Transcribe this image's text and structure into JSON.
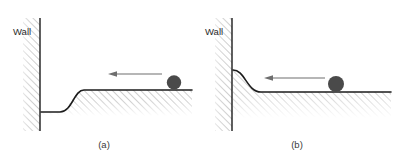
{
  "figure": {
    "background_color": "#ffffff",
    "panels": [
      {
        "id": "a",
        "caption": "(a)",
        "wall_label": "Wall",
        "description": "Ball rolling left toward a wall with ground that dips downward into a depression at the wall base",
        "ground_profile": "flat-plateau-then-S-curve-down-to-wall-base",
        "ball": {
          "name": "ball",
          "color": "#4a4a4a",
          "radius_px": 7,
          "center_x_px": 174,
          "center_y_px": 82
        },
        "arrow": {
          "name": "velocity-arrow",
          "direction": "left",
          "color": "#6e6e6e",
          "x_start_px": 162,
          "x_end_px": 110,
          "y_px": 74
        },
        "wall": {
          "x_px": 40,
          "top_y_px": 18,
          "bottom_y_px": 131,
          "hatch_side": "left",
          "hatch_width_px": 17
        },
        "ground": {
          "flat_y_px": 90,
          "base_y_px": 112,
          "curve_start_x_px": 78,
          "curve_end_x_px": 41,
          "right_edge_x_px": 192
        }
      },
      {
        "id": "b",
        "caption": "(b)",
        "wall_label": "Wall",
        "description": "Ball rolling left toward a wall with ground that rises into a hump at the wall base",
        "ground_profile": "flat-then-hump-rising-up-to-wall",
        "ball": {
          "name": "ball",
          "color": "#4a4a4a",
          "radius_px": 8,
          "center_x_px": 139,
          "center_y_px": 84
        },
        "arrow": {
          "name": "velocity-arrow",
          "direction": "left",
          "color": "#6e6e6e",
          "x_start_px": 126,
          "x_end_px": 68,
          "y_px": 78
        },
        "wall": {
          "x_px": 35,
          "top_y_px": 18,
          "bottom_y_px": 131,
          "hatch_side": "left",
          "hatch_width_px": 17
        },
        "ground": {
          "flat_y_px": 92,
          "peak_y_px": 70,
          "curve_start_x_px": 68,
          "curve_end_x_px": 36,
          "right_edge_x_px": 194
        }
      }
    ],
    "style": {
      "line_color": "#1c1c1c",
      "hatch_color": "#8a8a8a",
      "ball_color": "#4a4a4a",
      "arrow_color": "#6e6e6e",
      "text_color": "#2b2b2b"
    }
  }
}
